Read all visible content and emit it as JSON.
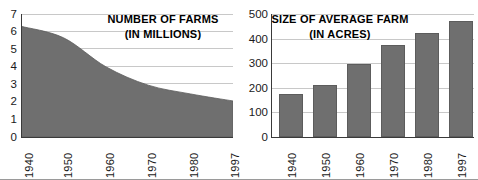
{
  "figure": {
    "background_color": "#ffffff",
    "fill_color": "#6f6f6f",
    "grid_color": "#c8c8c8",
    "axis_color": "#3a3a3a",
    "text_color": "#1a1a1a"
  },
  "chart_data": [
    {
      "type": "area",
      "title": "NUMBER OF FARMS",
      "subtitle": "(IN MILLIONS)",
      "xlabel": "",
      "ylabel": "",
      "ylim": [
        0,
        7
      ],
      "yticks": [
        0,
        1,
        2,
        3,
        4,
        5,
        6,
        7
      ],
      "ytick_labels": [
        "0",
        "1",
        "2",
        "3",
        "4",
        "5",
        "6",
        "7"
      ],
      "grid": true,
      "legend": "none",
      "x": [
        1940,
        1950,
        1960,
        1970,
        1980,
        1997
      ],
      "xtick_labels": [
        "1940",
        "1950",
        "1960",
        "1970",
        "1980",
        "1997"
      ],
      "values": [
        6.3,
        5.65,
        4.0,
        2.95,
        2.45,
        2.05
      ]
    },
    {
      "type": "bar",
      "title": "SIZE OF AVERAGE FARM",
      "subtitle": "(IN ACRES)",
      "xlabel": "",
      "ylabel": "",
      "ylim": [
        0,
        500
      ],
      "yticks": [
        0,
        100,
        200,
        300,
        400,
        500
      ],
      "ytick_labels": [
        "0",
        "100",
        "200",
        "300",
        "400",
        "500"
      ],
      "grid": true,
      "legend": "none",
      "categories": [
        "1940",
        "1950",
        "1960",
        "1970",
        "1980",
        "1997"
      ],
      "values": [
        175,
        213,
        297,
        373,
        423,
        470
      ]
    }
  ]
}
